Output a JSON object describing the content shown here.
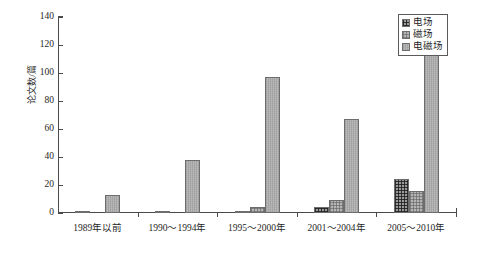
{
  "chart_data": {
    "type": "bar",
    "title": "",
    "subtitle": "",
    "xlabel": "",
    "ylabel": "论文数/篇",
    "categories": [
      "1989年以前",
      "1990～1994年",
      "1995～2000年",
      "2001～2004年",
      "2005～2010年"
    ],
    "series": [
      {
        "name": "电场",
        "values": [
          1,
          1,
          1,
          4,
          24
        ]
      },
      {
        "name": "磁场",
        "values": [
          0,
          0,
          4,
          9,
          16
        ]
      },
      {
        "name": "电磁场",
        "values": [
          13,
          38,
          97,
          67,
          124
        ]
      }
    ],
    "ylim": [
      0,
      140
    ],
    "yticks": [
      0,
      20,
      40,
      60,
      80,
      100,
      120,
      140
    ],
    "ytick_labels": [
      "0",
      "20",
      "40",
      "60",
      "80",
      "100",
      "120",
      "140"
    ],
    "grid": false,
    "legend_position": "top-right",
    "legend_entries": [
      "电场",
      "磁场",
      "电磁场"
    ],
    "colors": [
      "#9a9a9a",
      "#b4b4b4",
      "#b9b9b9"
    ],
    "axis_color": "#4a4a4a",
    "background": "#ffffff"
  },
  "axis": {
    "y_title": "论文数/篇"
  }
}
